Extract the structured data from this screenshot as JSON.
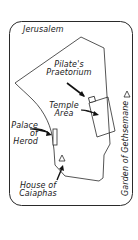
{
  "map": {
    "title": "Jerusalem",
    "labels": {
      "pilates_praetorium": [
        "Pilate's",
        "Praetorium"
      ],
      "temple_area": [
        "Temple",
        "Area"
      ],
      "palace_of_herod": [
        "Palace",
        "of",
        "Herod"
      ],
      "house_of_caiaphas": [
        "House of",
        "Caiaphas"
      ],
      "garden_of_gethsemane": "Garden of Gethsemane"
    },
    "markers": {
      "gethsemane": "triangle",
      "caiaphas": "triangle"
    },
    "colors": {
      "line": "#2a2a2a",
      "background": "#ffffff",
      "text": "#1a1a1a"
    }
  }
}
